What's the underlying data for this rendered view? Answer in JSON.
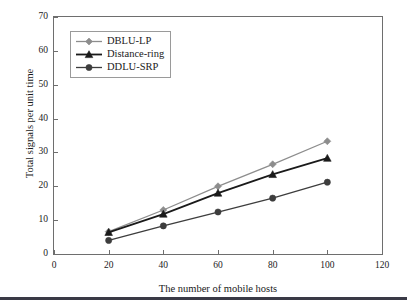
{
  "figure": {
    "background_color": "#ffffff",
    "frame_color": "#6e6e6e",
    "bottom_rule_color": "#3a3a46"
  },
  "chart_data": {
    "type": "line",
    "title": "",
    "xlabel": "The number of mobile hosts",
    "ylabel": "Total signals per unit time",
    "x": [
      20,
      40,
      60,
      80,
      100
    ],
    "xlim": [
      0,
      120
    ],
    "ylim": [
      0,
      70
    ],
    "xticks": [
      0,
      20,
      40,
      60,
      80,
      100,
      120
    ],
    "yticks": [
      0,
      10,
      20,
      30,
      40,
      50,
      60,
      70
    ],
    "grid": false,
    "legend_position": "upper-left",
    "series": [
      {
        "name": "DBLU-LP",
        "values": [
          6.6,
          13.0,
          20.0,
          26.5,
          33.3
        ],
        "color": "#8d8d8d",
        "marker": "diamond"
      },
      {
        "name": "Distance-ring",
        "values": [
          6.4,
          11.8,
          18.0,
          23.5,
          28.3
        ],
        "color": "#1a1a1a",
        "marker": "triangle"
      },
      {
        "name": "DDLU-SRP",
        "values": [
          4.0,
          8.3,
          12.4,
          16.5,
          21.2
        ],
        "color": "#3d3d3d",
        "marker": "circle"
      }
    ]
  }
}
